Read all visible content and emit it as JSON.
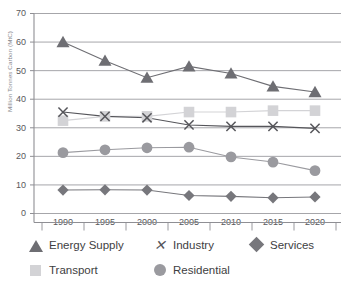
{
  "chart_data": {
    "type": "line",
    "title": "",
    "xlabel": "",
    "ylabel": "Million Tonnes Carbon (MtC)",
    "categories": [
      "1990",
      "1995",
      "2000",
      "2005",
      "2010",
      "2015",
      "2020"
    ],
    "ylim": [
      0,
      70
    ],
    "yticks": [
      0,
      10,
      20,
      30,
      40,
      50,
      60,
      70
    ],
    "grid": "horizontal",
    "legend_position": "bottom",
    "series": [
      {
        "name": "Energy Supply",
        "marker": "triangle",
        "color": "#6e6e73",
        "values": [
          60.0,
          53.5,
          47.5,
          51.5,
          49.0,
          44.5,
          42.5
        ]
      },
      {
        "name": "Industry",
        "marker": "cross",
        "color": "#55555a",
        "values": [
          35.5,
          34.0,
          33.5,
          31.0,
          30.5,
          30.5,
          29.8
        ]
      },
      {
        "name": "Services",
        "marker": "diamond",
        "color": "#77777c",
        "values": [
          8.2,
          8.3,
          8.2,
          6.3,
          6.0,
          5.5,
          5.8
        ]
      },
      {
        "name": "Transport",
        "marker": "square",
        "color": "#d3d3d6",
        "values": [
          32.5,
          34.0,
          34.0,
          35.5,
          35.5,
          36.0,
          36.0
        ]
      },
      {
        "name": "Residential",
        "marker": "circle",
        "color": "#9a9a9f",
        "values": [
          21.3,
          22.3,
          23.0,
          23.2,
          19.8,
          18.0,
          15.0
        ]
      }
    ]
  },
  "axis": {
    "y_tick_labels": [
      "70",
      "60",
      "50",
      "40",
      "30",
      "20",
      "10",
      "0"
    ],
    "x_tick_labels": [
      "1990",
      "1995",
      "2000",
      "2005",
      "2010",
      "2015",
      "2020"
    ],
    "y_axis_title": "Million Tonnes Carbon (MtC)"
  },
  "legend": {
    "row1": [
      {
        "label": "Energy Supply",
        "marker": "triangle-marker-icon"
      },
      {
        "label": "Industry",
        "marker": "cross-marker-icon"
      },
      {
        "label": "Services",
        "marker": "diamond-marker-icon"
      }
    ],
    "row2": [
      {
        "label": "Transport",
        "marker": "square-marker-icon"
      },
      {
        "label": "Residential",
        "marker": "circle-marker-icon"
      }
    ]
  },
  "colors": {
    "energy_supply": "#6e6e73",
    "industry": "#55555a",
    "services": "#77777c",
    "transport": "#d3d3d6",
    "residential": "#9a9a9f",
    "grid": "#a6a6aa",
    "axis": "#8f8f94",
    "text": "#58585c"
  }
}
